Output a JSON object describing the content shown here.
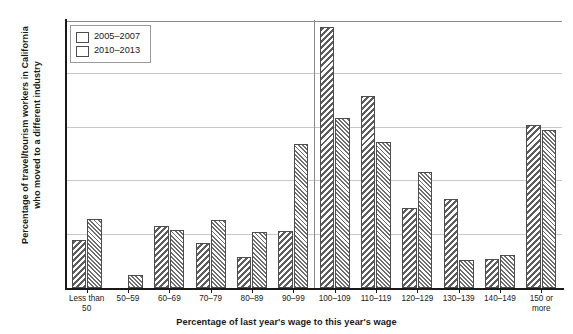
{
  "chart_data": {
    "type": "bar",
    "title": "",
    "xlabel": "Percentage of last year's wage to this year's wage",
    "ylabel_line1": "Percentage of travel/tourism workers in California",
    "ylabel_line2": "who moved to a different industry",
    "categories": [
      "Less than\n50",
      "50–59",
      "60–69",
      "70–79",
      "80–89",
      "90–99",
      "100–109",
      "110–119",
      "120–129",
      "130–139",
      "140–149",
      "150 or\nmore"
    ],
    "series": [
      {
        "name": "2005–2007",
        "values": [
          4.5,
          null,
          5.8,
          4.2,
          2.9,
          5.3,
          24.4,
          18.0,
          7.5,
          8.3,
          2.7,
          15.3
        ]
      },
      {
        "name": "2010–2013",
        "values": [
          6.5,
          1.2,
          5.4,
          6.4,
          5.2,
          13.5,
          15.9,
          13.7,
          10.9,
          2.6,
          3.1,
          14.8
        ]
      }
    ],
    "ylim": [
      0,
      25
    ],
    "yticks": [
      0,
      5,
      10,
      15,
      20,
      25
    ],
    "ytick_labels": [
      "0",
      "5",
      "10",
      "15",
      "20",
      "25"
    ],
    "grid": true,
    "legend_position": "top-left",
    "divider_after_category_index": 5,
    "colors": {
      "series0_hatch": "#5e5e5e",
      "series1_hatch": "#6e6e6e",
      "bar_outline": "#4d4d4d",
      "gridline": "#c8c8c8",
      "axis": "#1a1a1a",
      "background": "#ffffff"
    }
  }
}
